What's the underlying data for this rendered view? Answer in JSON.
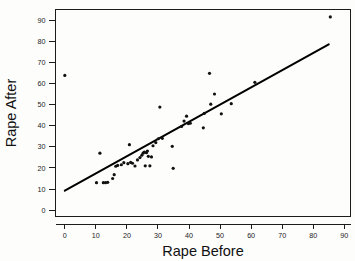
{
  "chart_data": {
    "type": "scatter",
    "title": "",
    "xlabel": "Rape Before",
    "ylabel": "Rape After",
    "xlim": [
      -3,
      92
    ],
    "ylim": [
      -3,
      95
    ],
    "xticks": [
      0,
      10,
      20,
      30,
      40,
      50,
      60,
      70,
      80,
      90
    ],
    "yticks": [
      0,
      10,
      20,
      30,
      40,
      50,
      60,
      70,
      80,
      90
    ],
    "xticklabels": [
      "0",
      "10",
      "20",
      "30",
      "40",
      "50",
      "60",
      "70",
      "80",
      "90"
    ],
    "yticklabels": [
      "0",
      "10",
      "20",
      "30",
      "40",
      "50",
      "60",
      "70",
      "80",
      "90"
    ],
    "grid": false,
    "legend": null,
    "marker": "point",
    "marker_size": 1.6,
    "points": [
      [
        0.0,
        63.8
      ],
      [
        10.2,
        13.0
      ],
      [
        11.3,
        27.0
      ],
      [
        12.4,
        13.0
      ],
      [
        13.1,
        13.0
      ],
      [
        13.8,
        13.2
      ],
      [
        15.4,
        15.0
      ],
      [
        15.9,
        16.8
      ],
      [
        16.4,
        20.8
      ],
      [
        17.0,
        21.2
      ],
      [
        18.2,
        21.5
      ],
      [
        19.0,
        22.5
      ],
      [
        20.3,
        22.0
      ],
      [
        20.8,
        31.0
      ],
      [
        21.2,
        22.6
      ],
      [
        21.8,
        22.2
      ],
      [
        22.6,
        20.9
      ],
      [
        23.4,
        23.8
      ],
      [
        24.2,
        24.9
      ],
      [
        24.8,
        26.0
      ],
      [
        25.2,
        27.0
      ],
      [
        25.6,
        27.5
      ],
      [
        25.9,
        21.0
      ],
      [
        26.3,
        27.2
      ],
      [
        26.6,
        28.0
      ],
      [
        26.9,
        25.5
      ],
      [
        27.4,
        21.0
      ],
      [
        27.9,
        25.2
      ],
      [
        28.4,
        30.5
      ],
      [
        29.3,
        32.0
      ],
      [
        30.1,
        33.8
      ],
      [
        30.6,
        48.8
      ],
      [
        31.4,
        34.0
      ],
      [
        34.6,
        30.2
      ],
      [
        34.9,
        19.8
      ],
      [
        37.6,
        39.6
      ],
      [
        38.4,
        42.2
      ],
      [
        39.2,
        44.5
      ],
      [
        39.8,
        41.0
      ],
      [
        40.4,
        41.2
      ],
      [
        44.6,
        39.0
      ],
      [
        44.9,
        45.8
      ],
      [
        46.6,
        64.8
      ],
      [
        47.0,
        50.2
      ],
      [
        48.2,
        55.0
      ],
      [
        50.4,
        45.6
      ],
      [
        53.6,
        50.4
      ],
      [
        61.2,
        60.5
      ],
      [
        85.5,
        91.5
      ]
    ],
    "fit_line": {
      "label": "least-squares fit",
      "x_start": 0.0,
      "y_start": 9.2,
      "x_end": 85.0,
      "y_end": 78.5
    }
  }
}
